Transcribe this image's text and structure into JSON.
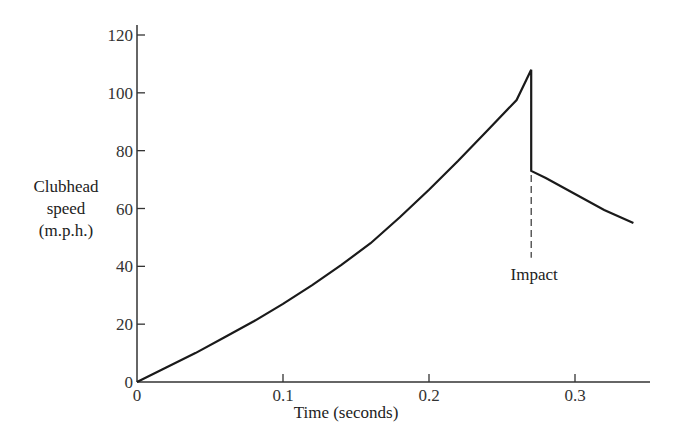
{
  "chart_data": {
    "type": "line",
    "title": "",
    "xlabel": "Time (seconds)",
    "ylabel": "Clubhead speed (m.p.h.)",
    "ylabel_lines": [
      "Clubhead",
      "speed",
      "(m.p.h.)"
    ],
    "xlim": [
      0,
      0.35
    ],
    "ylim": [
      0,
      120
    ],
    "x_ticks": [
      0,
      0.1,
      0.2,
      0.3
    ],
    "x_tick_labels": [
      "0",
      "0.1",
      "0.2",
      "0.3"
    ],
    "y_ticks": [
      0,
      20,
      40,
      60,
      80,
      100,
      120
    ],
    "y_tick_labels": [
      "0",
      "20",
      "40",
      "60",
      "80",
      "100",
      "120"
    ],
    "grid": false,
    "legend": null,
    "series": [
      {
        "name": "Clubhead speed",
        "x": [
          0,
          0.02,
          0.04,
          0.06,
          0.08,
          0.1,
          0.12,
          0.14,
          0.16,
          0.18,
          0.2,
          0.22,
          0.24,
          0.26,
          0.27,
          0.27,
          0.28,
          0.3,
          0.32,
          0.34
        ],
        "values": [
          0,
          5,
          10,
          15.5,
          21,
          27,
          33.5,
          40.5,
          48,
          57,
          66.5,
          76.5,
          87,
          97.5,
          108,
          73,
          70.5,
          65,
          59.5,
          55
        ]
      }
    ],
    "annotations": [
      {
        "text": "Impact",
        "x": 0.27,
        "style": "dashed vertical line from post-impact point down to label",
        "y_from": 73,
        "y_to": 43
      }
    ],
    "colors": {
      "line": "#1a1a1a",
      "axis": "#333333"
    }
  }
}
